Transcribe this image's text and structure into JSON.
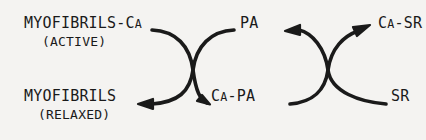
{
  "diagram": {
    "background_color": "#f4f3f1",
    "stroke_color": "#1a1a1a",
    "text_color": "#1a1a1a",
    "nodes": {
      "myofibrils_ca": {
        "main_prefix": "MYOFIBRILS-C",
        "main_smallcap": "A",
        "sub": "(ACTIVE)",
        "full_text": "MYOFIBRILS-Ca (ACTIVE)"
      },
      "myofibrils": {
        "main_prefix": "MYOFIBRILS",
        "main_smallcap": "",
        "sub": "(RELAXED)",
        "full_text": "MYOFIBRILS (RELAXED)"
      },
      "pa": {
        "main_prefix": "PA",
        "main_smallcap": "",
        "full_text": "PA"
      },
      "ca_pa": {
        "main_prefix": "C",
        "main_smallcap": "A",
        "main_suffix": "-PA",
        "full_text": "Ca-PA"
      },
      "ca_sr": {
        "main_prefix": "C",
        "main_smallcap": "A",
        "main_suffix": "-SR",
        "full_text": "Ca-SR"
      },
      "sr": {
        "main_prefix": "SR",
        "main_smallcap": "",
        "full_text": "SR"
      }
    },
    "arrows": [
      {
        "name": "myofibrils-ca-to-ca-pa",
        "from": "MYOFIBRILS-Ca",
        "to": "Ca-PA",
        "arrowhead": "end"
      },
      {
        "name": "pa-to-myofibrils",
        "from": "PA",
        "to": "MYOFIBRILS",
        "arrowhead": "end"
      },
      {
        "name": "ca-pa-to-ca-sr",
        "from": "Ca-PA",
        "to": "Ca-SR",
        "arrowhead": "end"
      },
      {
        "name": "sr-to-pa",
        "from": "SR",
        "to": "PA",
        "arrowhead": "end"
      }
    ]
  }
}
